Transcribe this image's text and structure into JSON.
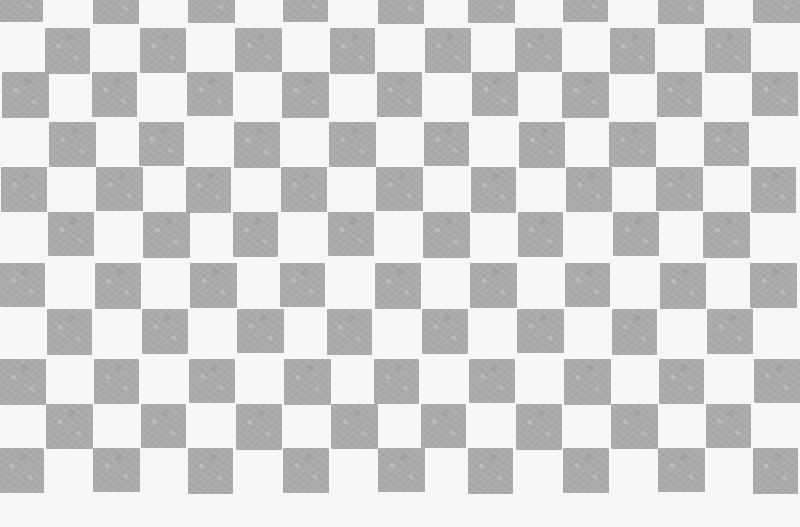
{
  "image": {
    "description": "Hand-drawn gray and white checkerboard pattern on paper",
    "width": 773,
    "height": 527,
    "colors": {
      "background": "#f6f6f6",
      "square": "#aaaaaa"
    },
    "grid": {
      "col_width": 47,
      "col_start": 0,
      "num_cols": 17,
      "row_tops": [
        -20,
        27,
        73,
        120,
        167,
        214,
        262,
        310,
        357,
        404,
        450
      ],
      "row_height": 45,
      "bottom_edge": 495,
      "first_row_offset": 0
    }
  }
}
